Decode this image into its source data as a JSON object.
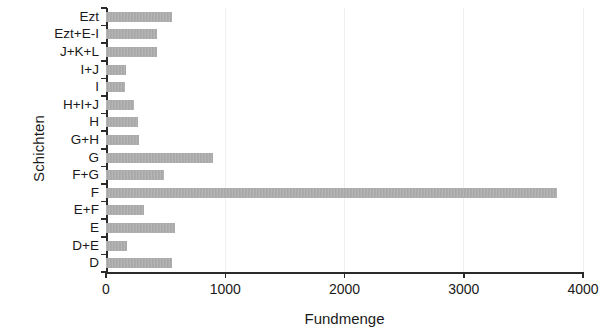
{
  "chart_data": {
    "type": "bar",
    "orientation": "horizontal",
    "title": "",
    "xlabel": "Fundmenge",
    "ylabel": "Schichten",
    "categories": [
      "Ezt",
      "Ezt+E-I",
      "J+K+L",
      "I+J",
      "I",
      "H+I+J",
      "H",
      "G+H",
      "G",
      "F+G",
      "F",
      "E+F",
      "E",
      "D+E",
      "D"
    ],
    "values": [
      550,
      425,
      430,
      170,
      160,
      235,
      265,
      280,
      900,
      485,
      3780,
      320,
      580,
      180,
      555
    ],
    "xlim": [
      0,
      4000
    ],
    "xticks": [
      0,
      1000,
      2000,
      3000,
      4000
    ],
    "xtick_labels": [
      "0",
      "1000",
      "2000",
      "3000",
      "4000"
    ],
    "grid": "vertical-faint",
    "legend": "none",
    "bar_color": "#a9a9a9",
    "axis_color": "#2b2b2b",
    "background_color": "#ffffff"
  },
  "figure": {
    "ylabel_text": "Schichten",
    "xlabel_text": "Fundmenge"
  }
}
